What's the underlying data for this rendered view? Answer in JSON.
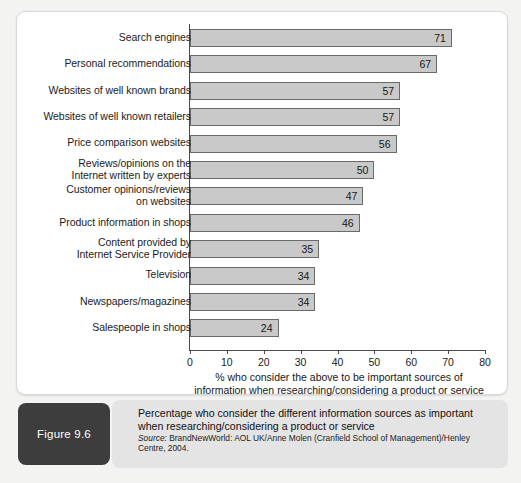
{
  "figure": {
    "badge_label": "Figure 9.6",
    "caption_line1": "Percentage who consider the different information sources as important",
    "caption_line2": "when researching/considering a product or service",
    "source_prefix": "Source:",
    "source_text": " BrandNewWorld: AOL UK/Anne Molen (Cranfield School of Management)/Henley Centre, 2004."
  },
  "chart_data": {
    "type": "bar",
    "orientation": "horizontal",
    "title": "",
    "xlabel_line1": "% who consider the above to be important sources of",
    "xlabel_line2": "information when researching/considering a product or service",
    "ylabel": "",
    "xlim": [
      0,
      80
    ],
    "xticks": [
      0,
      10,
      20,
      30,
      40,
      50,
      60,
      70,
      80
    ],
    "xtick_labels": [
      "0",
      "10",
      "20",
      "30",
      "40",
      "50",
      "60",
      "70",
      "80"
    ],
    "grid": false,
    "legend": false,
    "bar_fill": "#c9c9c9",
    "bar_border": "#6a6a6a",
    "categories": [
      "Search engines",
      "Personal recommendations",
      "Websites of well known brands",
      "Websites of well known retailers",
      "Price comparison websites",
      "Reviews/opinions on the\nInternet written by experts",
      "Customer opinions/reviews\non websites",
      "Product information in shops",
      "Content provided by\nInternet Service Provider",
      "Television",
      "Newspapers/magazines",
      "Salespeople in shops"
    ],
    "values": [
      71,
      67,
      57,
      57,
      56,
      50,
      47,
      46,
      35,
      34,
      34,
      24
    ],
    "value_labels": [
      "71",
      "67",
      "57",
      "57",
      "56",
      "50",
      "47",
      "46",
      "35",
      "34",
      "34",
      "24"
    ]
  }
}
